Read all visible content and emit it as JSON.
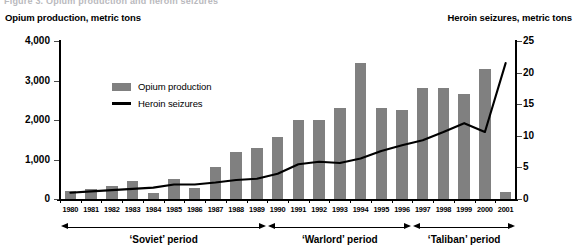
{
  "cutoff_header": "Figure 3. Opium production and heroin seizures",
  "axis_titles": {
    "left": "Opium production, metric tons",
    "right": "Heroin seizures, metric tons"
  },
  "legend": {
    "items": [
      {
        "label": "Opium production",
        "marker": "bar-swatch",
        "color": "#808080"
      },
      {
        "label": "Heroin seizures",
        "marker": "line-swatch",
        "color": "#000000"
      }
    ]
  },
  "periods": [
    {
      "label": "‘Soviet’ period",
      "start_year": "1980",
      "end_year": "1989"
    },
    {
      "label": "‘Warlord’ period",
      "start_year": "1990",
      "end_year": "1996"
    },
    {
      "label": "‘Taliban’ period",
      "start_year": "1997",
      "end_year": "2001"
    }
  ],
  "colors": {
    "bar": "#808080",
    "line": "#000000",
    "axis": "#000000",
    "background": "#ffffff"
  },
  "chart_data": {
    "type": "bar",
    "title": "Opium production and heroin seizures",
    "xlabel": "",
    "ylabel": "Opium production, metric tons",
    "y2label": "Heroin seizures, metric tons",
    "ylim": [
      0,
      4000
    ],
    "y2lim": [
      0,
      25
    ],
    "yticks": [
      "0",
      "1,000",
      "2,000",
      "3,000",
      "4,000"
    ],
    "ytick_values": [
      0,
      1000,
      2000,
      3000,
      4000
    ],
    "y2ticks": [
      "0",
      "5",
      "10",
      "15",
      "20",
      "25"
    ],
    "y2tick_values": [
      0,
      5,
      10,
      15,
      20,
      25
    ],
    "grid": false,
    "legend_position": "upper-left-inside",
    "categories": [
      "1980",
      "1981",
      "1982",
      "1983",
      "1984",
      "1985",
      "1986",
      "1987",
      "1988",
      "1989",
      "1990",
      "1991",
      "1992",
      "1993",
      "1994",
      "1995",
      "1996",
      "1997",
      "1998",
      "1999",
      "2000",
      "2001"
    ],
    "series": [
      {
        "name": "Opium production",
        "type": "bar",
        "axis": "left",
        "unit": "metric tons",
        "color": "#808080",
        "values": [
          200,
          250,
          330,
          450,
          150,
          500,
          290,
          800,
          1200,
          1300,
          1570,
          2000,
          2000,
          2300,
          3450,
          2300,
          2250,
          2800,
          2800,
          2650,
          3300,
          190
        ]
      },
      {
        "name": "Heroin seizures",
        "type": "line",
        "axis": "right",
        "unit": "metric tons",
        "color": "#000000",
        "values": [
          1.0,
          1.2,
          1.4,
          1.6,
          1.8,
          2.3,
          2.3,
          2.6,
          3.0,
          3.2,
          4.0,
          5.5,
          5.9,
          5.7,
          6.4,
          7.6,
          8.5,
          9.3,
          10.6,
          12.0,
          10.6,
          21.5
        ]
      }
    ]
  }
}
